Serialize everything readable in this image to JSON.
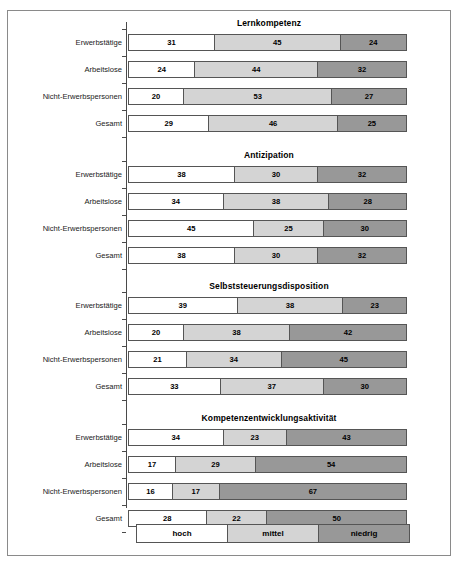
{
  "chart_data": {
    "type": "bar",
    "subtype": "stacked-horizontal-percent",
    "title": "",
    "xlabel": "",
    "ylabel": "",
    "xlim": [
      0,
      100
    ],
    "grid": false,
    "legend_position": "bottom",
    "legend": [
      "hoch",
      "mittel",
      "niedrig"
    ],
    "categories": [
      "Erwerbstätige",
      "Arbeitslose",
      "Nicht-Erwerbspersonen",
      "Gesamt"
    ],
    "panels": [
      {
        "title": "Lernkompetenz",
        "rows": [
          {
            "category": "Erwerbstätige",
            "values": [
              31,
              45,
              24
            ]
          },
          {
            "category": "Arbeitslose",
            "values": [
              24,
              44,
              32
            ]
          },
          {
            "category": "Nicht-Erwerbspersonen",
            "values": [
              20,
              53,
              27
            ]
          },
          {
            "category": "Gesamt",
            "values": [
              29,
              46,
              25
            ]
          }
        ]
      },
      {
        "title": "Antizipation",
        "rows": [
          {
            "category": "Erwerbstätige",
            "values": [
              38,
              30,
              32
            ]
          },
          {
            "category": "Arbeitslose",
            "values": [
              34,
              38,
              28
            ]
          },
          {
            "category": "Nicht-Erwerbspersonen",
            "values": [
              45,
              25,
              30
            ]
          },
          {
            "category": "Gesamt",
            "values": [
              38,
              30,
              32
            ]
          }
        ]
      },
      {
        "title": "Selbststeuerungsdisposition",
        "rows": [
          {
            "category": "Erwerbstätige",
            "values": [
              39,
              38,
              23
            ]
          },
          {
            "category": "Arbeitslose",
            "values": [
              20,
              38,
              42
            ]
          },
          {
            "category": "Nicht-Erwerbspersonen",
            "values": [
              21,
              34,
              45
            ]
          },
          {
            "category": "Gesamt",
            "values": [
              33,
              37,
              30
            ]
          }
        ]
      },
      {
        "title": "Kompetenzentwicklungsaktivität",
        "rows": [
          {
            "category": "Erwerbstätige",
            "values": [
              34,
              23,
              43
            ]
          },
          {
            "category": "Arbeitslose",
            "values": [
              17,
              29,
              54
            ]
          },
          {
            "category": "Nicht-Erwerbspersonen",
            "values": [
              16,
              17,
              67
            ]
          },
          {
            "category": "Gesamt",
            "values": [
              28,
              22,
              50
            ]
          }
        ]
      }
    ],
    "colors": {
      "hoch": "#ffffff",
      "mittel": "#d4d4d4",
      "niedrig": "#989898",
      "outline": "#555555",
      "frame": "#8a8a8a",
      "axis": "#4a4a4a"
    }
  }
}
